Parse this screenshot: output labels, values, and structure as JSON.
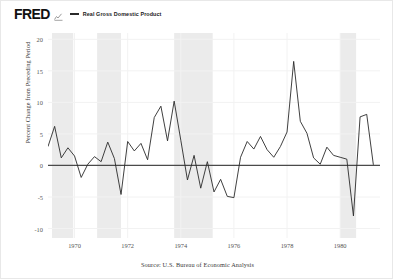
{
  "header": {
    "logo_text": "FRED",
    "logo_icon": "mini-line-chart-icon",
    "legend": [
      {
        "label": "Real Gross Domestic Product",
        "color": "#2a2a2a"
      }
    ]
  },
  "source": "Source: U.S. Bureau of Economic Analysis",
  "colors": {
    "line": "#2a2a2a",
    "zero_line": "#4a4a4a",
    "recession_band": "#ebebeb",
    "grid": "#f2f2f2",
    "border": "#e8e8e8",
    "tick_text": "#555555"
  },
  "chart_data": {
    "type": "line",
    "title": "Real Gross Domestic Product",
    "xlabel": "",
    "ylabel": "Percent Change from Preceding Period",
    "xlim": [
      1969.0,
      1981.5
    ],
    "ylim": [
      -11.5,
      21.0
    ],
    "grid": true,
    "legend_position": "top",
    "yticks": [
      20,
      15,
      10,
      5,
      0,
      -5,
      -10
    ],
    "ytick_labels": [
      "20",
      "15",
      "10",
      "5",
      "0",
      "-5",
      "-10"
    ],
    "xticks": [
      1970,
      1972,
      1974,
      1976,
      1978,
      1980
    ],
    "xtick_labels": [
      "1970",
      "1972",
      "1974",
      "1976",
      "1978",
      "1980"
    ],
    "zero_line": 0,
    "recession_bands": [
      {
        "start": 1969.15,
        "end": 1969.95
      },
      {
        "start": 1970.85,
        "end": 1971.75
      },
      {
        "start": 1973.75,
        "end": 1975.2
      },
      {
        "start": 1980.0,
        "end": 1980.6
      }
    ],
    "series": [
      {
        "name": "Real Gross Domestic Product",
        "color": "#2a2a2a",
        "x": [
          1969.0,
          1969.25,
          1969.5,
          1969.75,
          1970.0,
          1970.25,
          1970.5,
          1970.75,
          1971.0,
          1971.25,
          1971.5,
          1971.75,
          1972.0,
          1972.25,
          1972.5,
          1972.75,
          1973.0,
          1973.25,
          1973.5,
          1973.75,
          1974.0,
          1974.25,
          1974.5,
          1974.75,
          1975.0,
          1975.25,
          1975.5,
          1975.75,
          1976.0,
          1976.25,
          1976.5,
          1976.75,
          1977.0,
          1977.25,
          1977.5,
          1977.75,
          1978.0,
          1978.25,
          1978.5,
          1978.75,
          1979.0,
          1979.25,
          1979.5,
          1979.75,
          1980.0,
          1980.25,
          1980.5,
          1980.75,
          1981.0,
          1981.25
        ],
        "values": [
          3.0,
          6.2,
          1.2,
          2.8,
          1.5,
          -1.9,
          0.2,
          1.4,
          0.6,
          3.7,
          1.1,
          -4.6,
          3.8,
          2.3,
          3.5,
          0.9,
          7.6,
          9.4,
          3.9,
          10.2,
          4.0,
          -2.3,
          1.6,
          -3.6,
          0.6,
          -4.2,
          -2.2,
          -4.9,
          -5.1,
          1.3,
          3.8,
          2.6,
          4.6,
          2.5,
          1.3,
          3.0,
          5.3,
          16.5,
          7.0,
          5.1,
          1.2,
          0.2,
          2.9,
          1.6,
          1.3,
          1.0,
          -8.0,
          7.7,
          8.1,
          0.1
        ]
      }
    ]
  }
}
